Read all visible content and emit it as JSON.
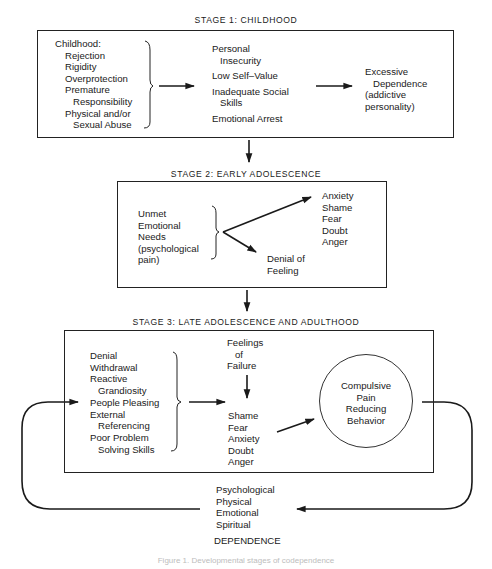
{
  "stage1": {
    "title": "STAGE 1:  CHILDHOOD",
    "causes_heading": "Childhood:",
    "causes": [
      "Rejection",
      "Rigidity",
      "Overprotection",
      "Premature",
      "   Responsibility",
      "Physical and/or",
      "   Sexual Abuse"
    ],
    "effects": [
      "Personal\n   Insecurity",
      "Low Self–Value",
      "Inadequate Social\n   Skills",
      "Emotional Arrest"
    ],
    "outcome": "Excessive\n   Dependence\n(addictive\npersonality)"
  },
  "stage2": {
    "title": "STAGE 2:  EARLY ADOLESCENCE",
    "source": "Unmet\nEmotional\nNeeds\n(psychological\npain)",
    "upper_outcome": "Anxiety\nShame\nFear\nDoubt\nAnger",
    "lower_outcome": "Denial of\nFeeling"
  },
  "stage3": {
    "title": "STAGE 3:  LATE ADOLESCENCE AND ADULTHOOD",
    "defenses": "Denial\nWithdrawal\nReactive\n   Grandiosity\nPeople Pleasing\nExternal\n   Referencing\nPoor Problem\n   Solving Skills",
    "trigger": "Feelings\n   of\nFailure",
    "emotions": "Shame\nFear\nAnxiety\nDoubt\nAnger",
    "behavior": "Compulsive\nPain\nReducing\nBehavior"
  },
  "dependence": {
    "types": "Psychological\nPhysical\nEmotional\nSpiritual",
    "label": "DEPENDENCE"
  },
  "caption": "Figure 1. Developmental stages of codependence",
  "colors": {
    "ink": "#1a1a1a",
    "caption": "#bdbdbd",
    "background": "#ffffff"
  }
}
